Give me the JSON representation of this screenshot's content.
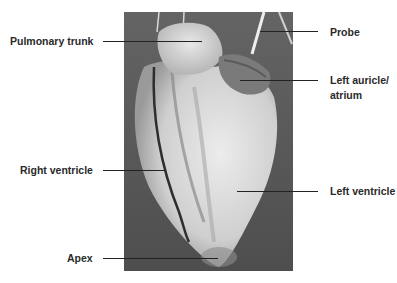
{
  "figure": {
    "labels": {
      "pulmonary_trunk": "Pulmonary trunk",
      "probe": "Probe",
      "left_auricle_line1": "Left auricle/",
      "left_auricle_line2": "atrium",
      "right_ventricle": "Right ventricle",
      "left_ventricle": "Left ventricle",
      "apex": "Apex"
    },
    "colors": {
      "background": "#ffffff",
      "photo_backdrop": "#5c5c5c",
      "tissue_light": "#e6e6e6",
      "tissue_mid": "#bdbdbd",
      "auricle": "#7a7a7a",
      "label_text": "#2a2a2a",
      "leader_line": "#222222"
    }
  }
}
